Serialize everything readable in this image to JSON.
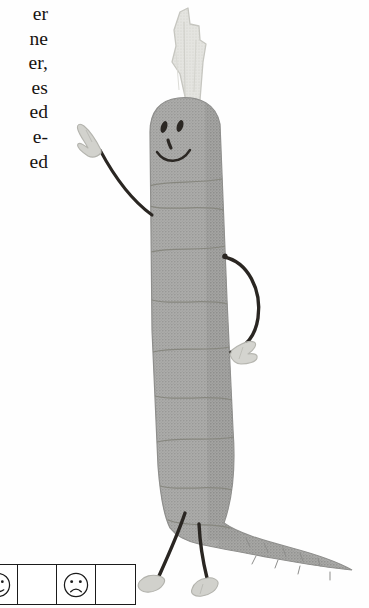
{
  "page": {
    "background_color": "#fefefe",
    "kind": "scanned-book-page-fragment"
  },
  "text_column": {
    "name": "body-text-fragment",
    "note": "right edge of a justified text column, left portion cropped off page",
    "lines": [
      "er",
      "ne",
      "er,",
      "es",
      "ed",
      "e-",
      "ed"
    ],
    "color": "#171310"
  },
  "rating_strip": {
    "name": "face-rating-scale",
    "border_color": "#1b1b1b",
    "cells": [
      {
        "id": "cell-1",
        "icon": "face-icon-partial",
        "label": ""
      },
      {
        "id": "cell-2",
        "icon": "",
        "label": ""
      },
      {
        "id": "cell-3",
        "icon": "sad-face-icon",
        "label": ""
      },
      {
        "id": "cell-4",
        "icon": "",
        "label": ""
      }
    ]
  },
  "illustration": {
    "name": "cartoon-carrot-character",
    "title": "Hand-drawn smiling carrot with arms and legs",
    "body_color": "#a9a9a7",
    "body_shade_color": "#9a9a98",
    "outline_color": "#8c8c8a",
    "ridge_color": "#8a8a88",
    "stem_color": "#e2e2dd",
    "stem_outline_color": "#c2c2bc",
    "limb_color": "#2a2622",
    "hand_color": "#d4d4cf",
    "face": {
      "expression": "smiling",
      "eyes": 2,
      "nose": 1,
      "mouth": "smile"
    },
    "parts": [
      "sprout-stem",
      "head",
      "body",
      "left-arm",
      "left-hand",
      "right-arm",
      "right-hand",
      "tapered-tail",
      "left-leg",
      "left-foot",
      "right-leg",
      "right-foot"
    ]
  }
}
